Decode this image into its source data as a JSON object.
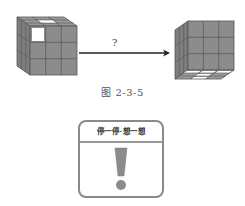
{
  "figure": {
    "arrow_label": "?",
    "caption": "图 2-3-5",
    "left_cube": {
      "description": "3x3 cube, front face top-left cell white, top face back-middle cell white",
      "face_color": "#8c8c8c",
      "highlight_color": "#ffffff"
    },
    "right_cube": {
      "description": "3x3 cube viewed from below, bottom face cells white in cross pattern",
      "face_color": "#8c8c8c",
      "highlight_color": "#ffffff"
    }
  },
  "notice_card": {
    "title": "停一停·想一想",
    "icon": "exclamation-icon",
    "border_color": "#8a8a8a"
  }
}
